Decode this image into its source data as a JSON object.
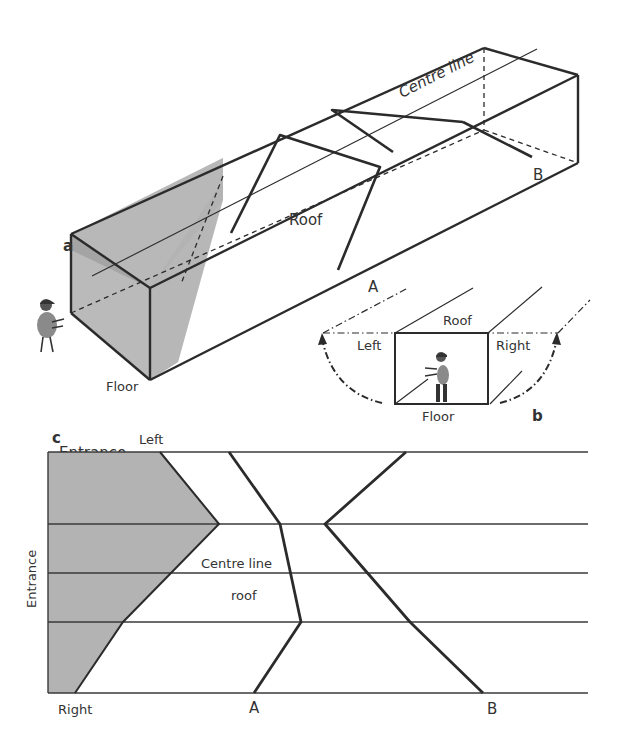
{
  "colors": {
    "line": "#2b2b2b",
    "shade": "#b3b3b3",
    "shade_dark": "#9a9a9a",
    "figure": "#8a8a8a",
    "background": "#ffffff"
  },
  "panel_a": {
    "label": "a",
    "texts": {
      "centre_line": "Centre line",
      "roof": "Roof",
      "floor": "Floor",
      "entrance": "Entrance",
      "crack_a": "A",
      "crack_b": "B"
    }
  },
  "panel_b": {
    "label": "b",
    "texts": {
      "roof": "Roof",
      "left": "Left",
      "right": "Right",
      "floor": "Floor"
    }
  },
  "panel_c": {
    "label": "c",
    "texts": {
      "left": "Left",
      "right": "Right",
      "entrance": "Entrance",
      "centre_line": "Centre line",
      "roof": "roof",
      "crack_a": "A",
      "crack_b": "B"
    },
    "rows_y": [
      452,
      524,
      573,
      622,
      693
    ],
    "x_start": 48,
    "x_end": 588,
    "shaded_polygon": [
      [
        48,
        452
      ],
      [
        160,
        452
      ],
      [
        219,
        524
      ],
      [
        171,
        573
      ],
      [
        123,
        622
      ],
      [
        75,
        693
      ],
      [
        48,
        693
      ]
    ],
    "crack_a_path": [
      [
        229,
        452
      ],
      [
        280,
        524
      ],
      [
        301,
        622
      ],
      [
        254,
        693
      ]
    ],
    "crack_b_path": [
      [
        406,
        452
      ],
      [
        325,
        524
      ],
      [
        410,
        622
      ],
      [
        483,
        693
      ]
    ]
  }
}
